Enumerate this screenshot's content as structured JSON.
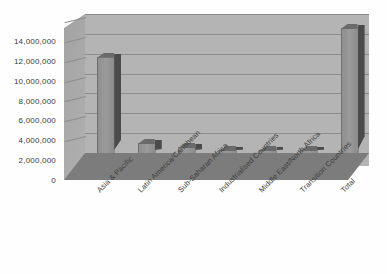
{
  "chart_data": {
    "type": "bar",
    "title": "",
    "subtitle": "",
    "xlabel": "",
    "ylabel": "",
    "categories": [
      "Asia & Pacific",
      "Latin America/Caribbean",
      "Sub-Saharan Africa",
      "Industrialised Countries",
      "Middle East/North Africa",
      "Transition Countries",
      "Total"
    ],
    "values": [
      9700000,
      1000000,
      600000,
      200000,
      250000,
      100000,
      12600000
    ],
    "ylim": [
      0,
      14000000
    ],
    "ytick_values": [
      0,
      2000000,
      4000000,
      6000000,
      8000000,
      10000000,
      12000000,
      14000000
    ],
    "ytick_labels": [
      "0",
      "2,000,000",
      "4,000,000",
      "6,000,000",
      "8,000,000",
      "10,000,000",
      "12,000,000",
      "14,000,000"
    ],
    "grid": true,
    "legend": "none",
    "style": "3d-grayscale",
    "colors": {
      "bar_face": "#949494",
      "bar_side": "#4b4b4b",
      "bar_top": "#6a6a6a",
      "wall": "#b4b4b4",
      "floor": "#7c7c7c",
      "gridline": "#8d8d8d",
      "text": "#3a3a3a",
      "background": "#ffffff"
    }
  }
}
